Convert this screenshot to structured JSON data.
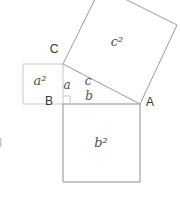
{
  "figure": {
    "type": "geometry-diagram",
    "width": 180,
    "height": 197,
    "background": "#ffffff",
    "colors": {
      "square_a_stroke": "#c9c9c9",
      "square_b_stroke": "#8d8d8d",
      "square_c_stroke": "#9a9a9a",
      "right_angle_stroke": "#c4c4c4",
      "vertex_label": "#353535",
      "math_label": "#4f4f4f",
      "edge_artifact": "#c8c8c8"
    },
    "vertices": [
      {
        "name": "A",
        "x": 140,
        "y": 104,
        "label_x": 150,
        "label_y": 103
      },
      {
        "name": "B",
        "x": 63,
        "y": 104,
        "label_x": 49,
        "label_y": 102
      },
      {
        "name": "C",
        "x": 63,
        "y": 64,
        "label_x": 54,
        "label_y": 50
      }
    ],
    "squares": [
      {
        "id": "a2",
        "label": "a²",
        "points": "23,64 63,64 63,104 23,104",
        "label_x": 40,
        "label_y": 81,
        "stroke_key": "square_a_stroke",
        "font_size": 13
      },
      {
        "id": "b2",
        "label": "b²",
        "points": "63,104 140,104 140,182 63,182",
        "label_x": 101,
        "label_y": 143,
        "stroke_key": "square_b_stroke",
        "font_size": 13
      },
      {
        "id": "c2",
        "label": "c²",
        "points": "63,64 101,-13 177,25 140,104",
        "label_x": 117,
        "label_y": 42,
        "stroke_key": "square_c_stroke",
        "font_size": 13
      }
    ],
    "side_labels": [
      {
        "id": "a",
        "label": "a",
        "x": 67,
        "y": 85,
        "font_size": 12
      },
      {
        "id": "c",
        "label": "c",
        "x": 88,
        "y": 81,
        "font_size": 12
      },
      {
        "id": "b",
        "label": "b",
        "x": 89,
        "y": 96,
        "font_size": 12
      }
    ],
    "right_angle_marker": {
      "points": "63,96 70,96 70,104"
    },
    "edge_artifact": {
      "x": 0,
      "y": 138,
      "width": 1.5,
      "height": 9
    }
  }
}
